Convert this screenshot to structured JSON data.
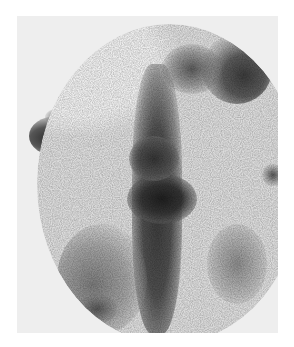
{
  "image": {
    "type": "grayscale scintigraphy-style scan",
    "colors": {
      "background": "#ffffff",
      "frame": "#eeeeee",
      "field": "#dcdcdc",
      "uptake_dark": "#2a2a2a",
      "uptake_mid": "#6a6a6a"
    }
  }
}
